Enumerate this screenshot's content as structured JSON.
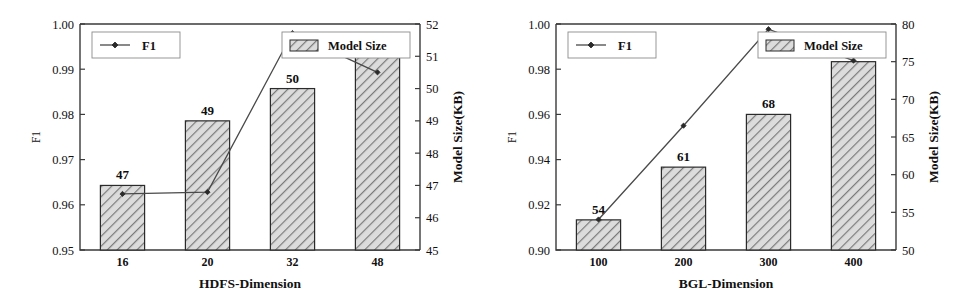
{
  "figure": {
    "panel_count": 2
  },
  "chart_data": [
    {
      "type": "bar",
      "title": "",
      "xlabel": "HDFS-Dimension",
      "ylabel": "F1",
      "y2label": "Model Size(KB)",
      "categories": [
        "16",
        "20",
        "32",
        "48"
      ],
      "ylim": [
        0.95,
        1.0
      ],
      "yticks": [
        "0.95",
        "0.96",
        "0.97",
        "0.98",
        "0.99",
        "1.00"
      ],
      "ytickvals": [
        0.95,
        0.96,
        0.97,
        0.98,
        0.99,
        1.0
      ],
      "y2lim": [
        45,
        52
      ],
      "y2ticks": [
        "45",
        "46",
        "47",
        "48",
        "49",
        "50",
        "51",
        "52"
      ],
      "y2tickvals": [
        45,
        46,
        47,
        48,
        49,
        50,
        51,
        52
      ],
      "grid": false,
      "legend_position": "top",
      "series": [
        {
          "name": "F1",
          "kind": "line",
          "axis": "left",
          "values": [
            0.9624,
            0.9628,
            0.998,
            0.9893
          ],
          "labels": [
            "",
            "",
            "",
            ""
          ]
        },
        {
          "name": "Model Size",
          "kind": "bar",
          "axis": "right",
          "values": [
            47,
            49,
            50,
            51
          ],
          "labels": [
            "47",
            "49",
            "50",
            "51"
          ]
        }
      ]
    },
    {
      "type": "bar",
      "title": "",
      "xlabel": "BGL-Dimension",
      "ylabel": "F1",
      "y2label": "Model Size(KB)",
      "categories": [
        "100",
        "200",
        "300",
        "400"
      ],
      "ylim": [
        0.9,
        1.0
      ],
      "yticks": [
        "0.90",
        "0.92",
        "0.94",
        "0.96",
        "0.98",
        "1.00"
      ],
      "ytickvals": [
        0.9,
        0.92,
        0.94,
        0.96,
        0.98,
        1.0
      ],
      "y2lim": [
        50,
        80
      ],
      "y2ticks": [
        "50",
        "55",
        "60",
        "65",
        "70",
        "75",
        "80"
      ],
      "y2tickvals": [
        50,
        55,
        60,
        65,
        70,
        75,
        80
      ],
      "grid": false,
      "legend_position": "top",
      "series": [
        {
          "name": "F1",
          "kind": "line",
          "axis": "left",
          "values": [
            0.9135,
            0.955,
            0.9977,
            0.9838
          ],
          "labels": [
            "",
            "",
            "",
            ""
          ]
        },
        {
          "name": "Model Size",
          "kind": "bar",
          "axis": "right",
          "values": [
            54,
            61,
            68,
            75
          ],
          "labels": [
            "54",
            "61",
            "68",
            "75"
          ]
        }
      ]
    }
  ],
  "legend": {
    "f1_label": "F1",
    "model_size_label": "Model Size"
  },
  "colors": {
    "bar_fill": "#d9d9d9",
    "bar_hatch": "#7a7a7a",
    "bar_edge": "#2b2b2b",
    "line": "#4a4a4a",
    "axis": "#3a3a3a",
    "text": "#111111"
  }
}
